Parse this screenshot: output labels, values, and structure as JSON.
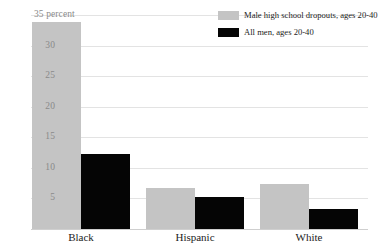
{
  "chart_data": {
    "type": "bar",
    "title": "",
    "subtitle": "",
    "xlabel": "",
    "ylabel": "35 percent",
    "unit": "percent",
    "categories": [
      "Black",
      "Hispanic",
      "White"
    ],
    "series": [
      {
        "name": "Male high school dropouts, ages 20-40",
        "color": "#c4c4c4",
        "values": [
          33.9,
          6.7,
          7.4
        ]
      },
      {
        "name": "All men, ages 20-40",
        "color": "#050505",
        "values": [
          12.3,
          5.2,
          3.2
        ]
      }
    ],
    "ylim": [
      0,
      35
    ],
    "yticks": [
      5,
      10,
      15,
      20,
      25,
      30,
      35
    ],
    "ytick_labels": [
      "5",
      "10",
      "15",
      "20",
      "25",
      "30",
      "35 percent"
    ],
    "grid": true,
    "legend_position": "top-right",
    "gridline_color": "#e3e3e3",
    "axis_color": "#cfcfcf",
    "tick_label_color": "#8a8a8a",
    "category_label_color": "#1c1c1c"
  },
  "legend": {
    "items": [
      {
        "label": "Male high school dropouts, ages 20-40",
        "swatch": "series-dropouts"
      },
      {
        "label": "All men, ages 20-40",
        "swatch": "series-allmen"
      }
    ]
  }
}
